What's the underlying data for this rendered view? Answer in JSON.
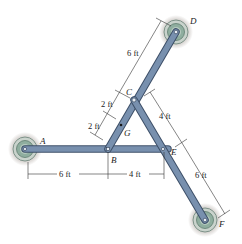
{
  "figure": {
    "points": {
      "A": {
        "label": "A",
        "x": 25,
        "y": 149
      },
      "B": {
        "label": "B",
        "x": 108,
        "y": 149
      },
      "E": {
        "label": "E",
        "x": 163,
        "y": 149
      },
      "C": {
        "label": "C",
        "x": 134,
        "y": 100
      },
      "D": {
        "label": "D",
        "x": 176,
        "y": 32
      },
      "F": {
        "label": "F",
        "x": 205,
        "y": 220
      },
      "G": {
        "label": "G",
        "x": 121,
        "y": 125
      }
    },
    "members": [
      {
        "name": "AE",
        "from": "A",
        "to": "E"
      },
      {
        "name": "BD",
        "from": "B",
        "to": "D"
      },
      {
        "name": "CF",
        "from": "C",
        "to": "F"
      }
    ],
    "dimensions": {
      "CD": "6 ft",
      "CG_upper": "2 ft",
      "GB_lower": "2 ft",
      "CE": "4 ft",
      "EF": "6 ft",
      "AB": "6 ft",
      "BE": "4 ft"
    },
    "colors": {
      "member": "#6f87a6",
      "member_edge": "#3d4f68",
      "support_outer": "#b9c4bd",
      "support_inner": "#7c9c8d",
      "shadow": "#9a9088"
    }
  }
}
